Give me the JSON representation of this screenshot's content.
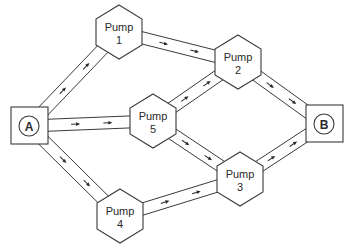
{
  "diagram": {
    "type": "network-flow",
    "colors": {
      "line": "#3a3a3a",
      "background": "#ffffff",
      "text": "#2a2a2a"
    },
    "nodes": [
      {
        "id": "A",
        "kind": "terminal",
        "label": "A",
        "x": 29,
        "y": 126
      },
      {
        "id": "B",
        "kind": "terminal",
        "label": "B",
        "x": 324,
        "y": 124
      },
      {
        "id": "P1",
        "kind": "pump",
        "label_line1": "Pump",
        "label_line2": "1",
        "x": 119,
        "y": 32
      },
      {
        "id": "P2",
        "kind": "pump",
        "label_line1": "Pump",
        "label_line2": "2",
        "x": 238,
        "y": 62
      },
      {
        "id": "P3",
        "kind": "pump",
        "label_line1": "Pump",
        "label_line2": "3",
        "x": 240,
        "y": 179
      },
      {
        "id": "P4",
        "kind": "pump",
        "label_line1": "Pump",
        "label_line2": "4",
        "x": 120,
        "y": 216
      },
      {
        "id": "P5",
        "kind": "pump",
        "label_line1": "Pump",
        "label_line2": "5",
        "x": 153,
        "y": 121
      }
    ],
    "edges": [
      {
        "from": "A",
        "to": "P1",
        "arrows": 2
      },
      {
        "from": "A",
        "to": "P5",
        "arrows": 2
      },
      {
        "from": "A",
        "to": "P4",
        "arrows": 2
      },
      {
        "from": "P1",
        "to": "P2",
        "arrows": 2
      },
      {
        "from": "P5",
        "to": "P2",
        "arrows": 2
      },
      {
        "from": "P5",
        "to": "P3",
        "arrows": 2
      },
      {
        "from": "P4",
        "to": "P3",
        "arrows": 2
      },
      {
        "from": "P2",
        "to": "B",
        "arrows": 2
      },
      {
        "from": "P3",
        "to": "B",
        "arrows": 2
      }
    ]
  }
}
